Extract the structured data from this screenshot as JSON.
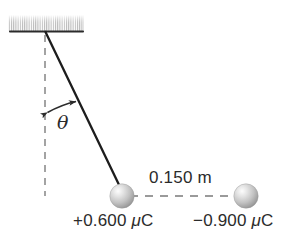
{
  "figure": {
    "background_color": "#ffffff",
    "ink_color": "#2b2b2b",
    "dashed_color": "#9a9a9a",
    "sphere_color_light": "#f2f2f2",
    "sphere_color_mid": "#c9c9c9",
    "sphere_color_dark": "#8f8f8f",
    "ceiling": {
      "name": "ceiling-support",
      "hatch_description": "vertical gradient hatching above solid line",
      "line_color": "#2b2b2b"
    },
    "angle": {
      "symbol": "θ",
      "measured_from": "vertical dashed line",
      "approx_degrees": 26
    },
    "separation": {
      "label": "0.150 m",
      "value": 0.15,
      "unit": "m"
    },
    "charges": [
      {
        "name": "pendulum-ball-charge",
        "label": "+0.600 μC",
        "sign": "+",
        "magnitude": "0.600",
        "unit": "μC",
        "position": "attached to string"
      },
      {
        "name": "fixed-charge",
        "label": "−0.900 μC",
        "sign": "−",
        "magnitude": "0.900",
        "unit": "μC",
        "position": "fixed to the right"
      }
    ]
  }
}
